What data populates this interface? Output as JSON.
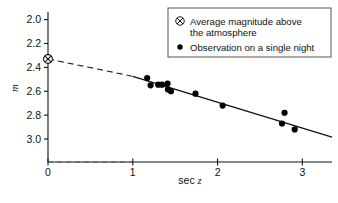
{
  "chart_data": {
    "type": "scatter",
    "title": "",
    "xlabel": "sec z",
    "ylabel": "m",
    "xlim": [
      0,
      3.35
    ],
    "ylim": [
      3.05,
      1.97
    ],
    "y_inverted": true,
    "grid": false,
    "xticks": [
      "0",
      "1",
      "2",
      "3"
    ],
    "xtick_values": [
      0,
      1,
      2,
      3
    ],
    "yticks": [
      "2.0",
      "2.2",
      "2.4",
      "2.6",
      "2.8",
      "3.0"
    ],
    "ytick_values": [
      2.0,
      2.2,
      2.4,
      2.6,
      2.8,
      3.0
    ],
    "series": [
      {
        "name": "Observation on a single night",
        "marker": "filled-circle",
        "color": "#000000",
        "points": [
          {
            "x": 1.17,
            "y": 2.49
          },
          {
            "x": 1.21,
            "y": 2.55
          },
          {
            "x": 1.3,
            "y": 2.545
          },
          {
            "x": 1.345,
            "y": 2.545
          },
          {
            "x": 1.41,
            "y": 2.535
          },
          {
            "x": 1.415,
            "y": 2.585
          },
          {
            "x": 1.45,
            "y": 2.6
          },
          {
            "x": 1.74,
            "y": 2.62
          },
          {
            "x": 2.06,
            "y": 2.72
          },
          {
            "x": 2.79,
            "y": 2.78
          },
          {
            "x": 2.76,
            "y": 2.87
          },
          {
            "x": 2.91,
            "y": 2.92
          }
        ]
      },
      {
        "name": "Average magnitude above the atmosphere",
        "marker": "circled-x",
        "color": "#000000",
        "points": [
          {
            "x": 0.0,
            "y": 2.33
          }
        ]
      }
    ],
    "fit_line": {
      "style": "solid",
      "x_start": 1.0,
      "x_end": 3.35,
      "y_start": 2.475,
      "y_end": 2.985,
      "slope": 0.217,
      "intercept": 2.258
    },
    "extrapolation_line": {
      "style": "dashed",
      "x_start": 0.0,
      "x_end": 1.0,
      "y_start": 2.33,
      "y_end": 2.475
    },
    "baseline": {
      "style": "dashed",
      "description": "dashed horizontal guide along bottom axis from x=0 to x=1"
    },
    "legend": {
      "position": "top-right",
      "boxed": true,
      "entries": [
        {
          "marker": "circled-x",
          "label_line1": "Average magnitude above",
          "label_line2": "the atmosphere"
        },
        {
          "marker": "filled-circle",
          "label_line1": "Observation on a single night",
          "label_line2": ""
        }
      ]
    }
  },
  "colors": {
    "axis": "#111111",
    "data": "#000000",
    "line": "#111111",
    "legend_border": "#444444",
    "background": "#ffffff"
  }
}
